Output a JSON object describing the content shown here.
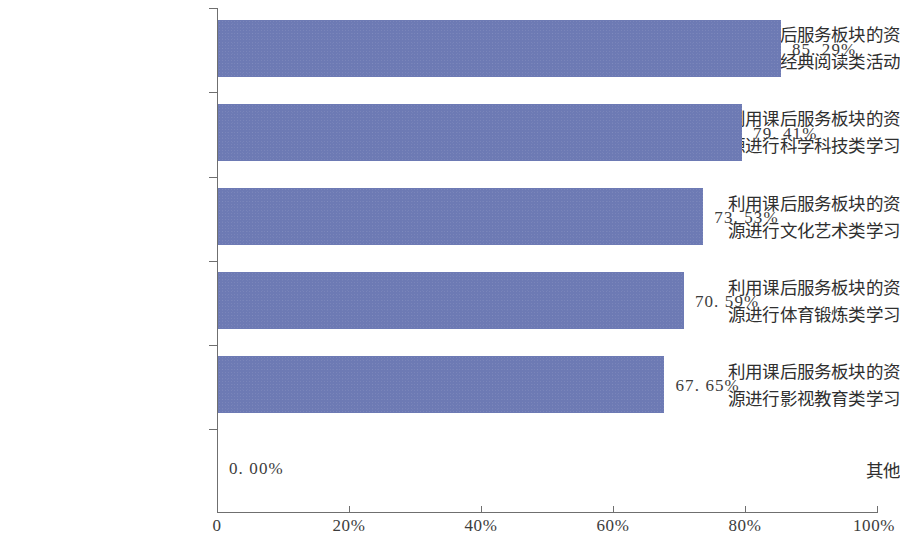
{
  "chart_data": {
    "type": "bar",
    "orientation": "horizontal",
    "title": "",
    "xlabel": "",
    "ylabel": "",
    "xlim": [
      0,
      100
    ],
    "grid": false,
    "legend": null,
    "bar_color": "#6d7ab4",
    "axis_color": "#6f6f6f",
    "categories": [
      "利用课后服务板块的资源进行经典阅读类活动",
      "利用课后服务板块的资源进行科学科技类学习",
      "利用课后服务板块的资源进行文化艺术类学习",
      "利用课后服务板块的资源进行体育锻炼类学习",
      "利用课后服务板块的资源进行影视教育类学习",
      "其他"
    ],
    "category_lines": [
      [
        "利用课后服务板块的资",
        "源进行经典阅读类活动"
      ],
      [
        "利用课后服务板块的资",
        "源进行科学科技类学习"
      ],
      [
        "利用课后服务板块的资",
        "源进行文化艺术类学习"
      ],
      [
        "利用课后服务板块的资",
        "源进行体育锻炼类学习"
      ],
      [
        "利用课后服务板块的资",
        "源进行影视教育类学习"
      ],
      [
        "其他",
        ""
      ]
    ],
    "values": [
      85.29,
      79.41,
      73.53,
      70.59,
      67.65,
      0.0
    ],
    "value_labels": [
      "85. 29%",
      "79. 41%",
      "73. 53%",
      "70. 59%",
      "67. 65%",
      "0. 00%"
    ],
    "xticks": [
      0,
      20,
      40,
      60,
      80,
      100
    ],
    "xtick_labels": [
      "0",
      "20%",
      "40%",
      "60%",
      "80%",
      "100%"
    ]
  }
}
